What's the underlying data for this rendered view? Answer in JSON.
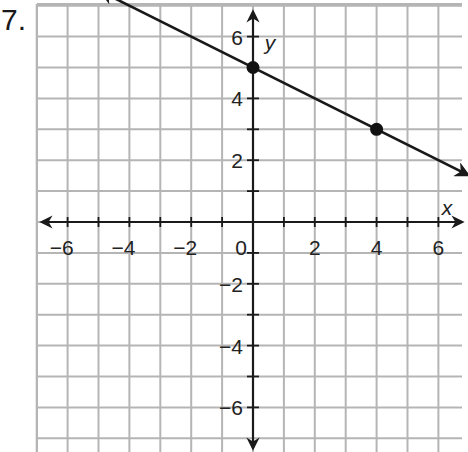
{
  "problem": {
    "number": "7."
  },
  "chart_data": {
    "type": "line",
    "title": "",
    "xlabel": "x",
    "ylabel": "y",
    "xlim": [
      -7,
      7
    ],
    "ylim": [
      -7,
      7
    ],
    "grid": true,
    "grid_step": 1,
    "x_tick_labels": [
      "−6",
      "−4",
      "−2",
      "0",
      "2",
      "4",
      "6"
    ],
    "y_tick_labels": [
      "6",
      "4",
      "2",
      "−2",
      "−4",
      "−6"
    ],
    "origin_label": "0",
    "series": [
      {
        "name": "line",
        "equation": "y = -0.5x + 5",
        "slope": -0.5,
        "intercept": 5,
        "arrows": "both",
        "marked_points": [
          {
            "x": 0,
            "y": 5
          },
          {
            "x": 4,
            "y": 3
          }
        ]
      }
    ],
    "colors": {
      "grid": "#b5b5b5",
      "axis": "#1a1a1a",
      "line": "#1a1a1a",
      "point": "#111111"
    }
  }
}
